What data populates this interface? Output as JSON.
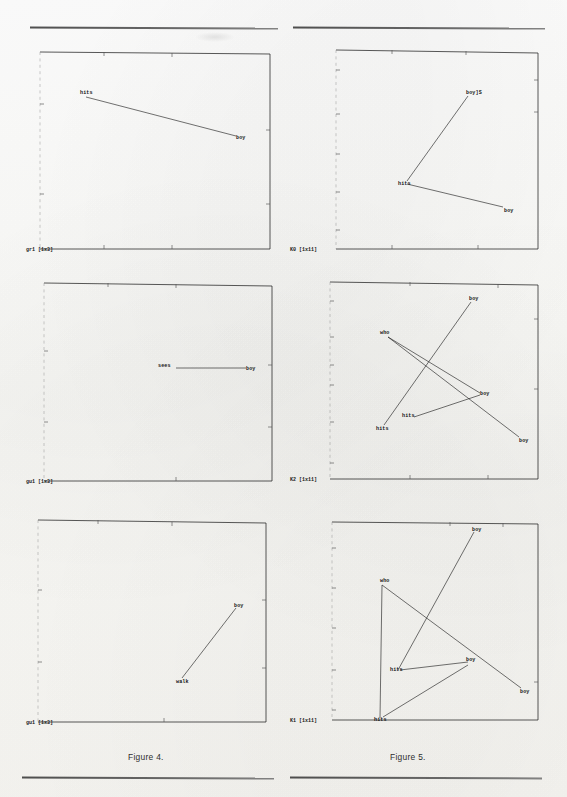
{
  "page": {
    "figure_left_caption": "Figure 4.",
    "figure_right_caption": "Figure 5."
  },
  "panels": [
    {
      "id": "panel-gr1",
      "column": "left",
      "row": 1,
      "axis_label": "gr1 [1x3]",
      "nodes": [
        {
          "label": "hits",
          "x": 62,
          "y": 50
        },
        {
          "label": "boy",
          "x": 212,
          "y": 90
        }
      ],
      "edges": [
        [
          0,
          1
        ]
      ]
    },
    {
      "id": "panel-k0",
      "column": "right",
      "row": 1,
      "axis_label": "K0 [1x11]",
      "nodes": [
        {
          "label": "boy]S",
          "x": 180,
          "y": 47
        },
        {
          "label": "hits",
          "x": 118,
          "y": 140
        },
        {
          "label": "boy",
          "x": 216,
          "y": 167
        }
      ],
      "edges": [
        [
          0,
          1
        ],
        [
          1,
          2
        ]
      ]
    },
    {
      "id": "panel-gu1",
      "column": "left",
      "row": 2,
      "axis_label": "gu1 [1x3]",
      "nodes": [
        {
          "label": "sees",
          "x": 148,
          "y": 90
        },
        {
          "label": "boy",
          "x": 222,
          "y": 90
        }
      ],
      "edges": [
        [
          0,
          1
        ]
      ]
    },
    {
      "id": "panel-k2",
      "column": "right",
      "row": 2,
      "axis_label": "K2 [1x11]",
      "nodes": [
        {
          "label": "boy",
          "x": 183,
          "y": 22
        },
        {
          "label": "who",
          "x": 98,
          "y": 57
        },
        {
          "label": "boy",
          "x": 192,
          "y": 120
        },
        {
          "label": "hits",
          "x": 120,
          "y": 140
        },
        {
          "label": "hits",
          "x": 95,
          "y": 152
        },
        {
          "label": "boy",
          "x": 231,
          "y": 165
        }
      ],
      "edges": [
        [
          1,
          5
        ],
        [
          1,
          2
        ],
        [
          0,
          4
        ]
      ]
    },
    {
      "id": "panel-gu1b",
      "column": "left",
      "row": 3,
      "axis_label": "gu1 [1x3]",
      "nodes": [
        {
          "label": "boy",
          "x": 210,
          "y": 93
        },
        {
          "label": "walk",
          "x": 155,
          "y": 162
        }
      ],
      "edges": [
        [
          0,
          1
        ]
      ]
    },
    {
      "id": "panel-k1",
      "column": "right",
      "row": 3,
      "axis_label": "K1 [1x11]",
      "nodes": [
        {
          "label": "boy",
          "x": 186,
          "y": 16
        },
        {
          "label": "who",
          "x": 100,
          "y": 68
        },
        {
          "label": "boy",
          "x": 180,
          "y": 152
        },
        {
          "label": "hits",
          "x": 110,
          "y": 158
        },
        {
          "label": "boy",
          "x": 233,
          "y": 180
        },
        {
          "label": "hits",
          "x": 92,
          "y": 208
        }
      ],
      "edges": [
        [
          1,
          5
        ],
        [
          1,
          4
        ],
        [
          0,
          3
        ],
        [
          3,
          2
        ],
        [
          2,
          5
        ]
      ]
    }
  ],
  "rules": [
    {
      "name": "top-left-rule"
    },
    {
      "name": "top-right-rule"
    },
    {
      "name": "bottom-left-rule"
    },
    {
      "name": "bottom-right-rule"
    }
  ]
}
